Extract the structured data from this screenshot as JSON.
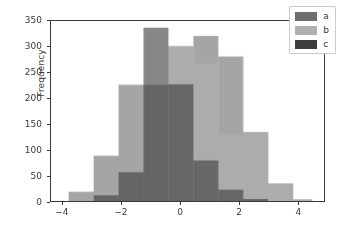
{
  "chart_data": {
    "type": "bar",
    "subtype": "histogram-overlapping",
    "title": "",
    "xlabel": "",
    "ylabel": "Frequency",
    "xlim": [
      -4.4,
      4.9
    ],
    "ylim": [
      0,
      350
    ],
    "grid": false,
    "legend_position": "upper right",
    "xticks": [
      -4,
      -2,
      0,
      2,
      4
    ],
    "xtick_labels": [
      "−4",
      "−2",
      "0",
      "2",
      "4"
    ],
    "yticks": [
      0,
      50,
      100,
      150,
      200,
      250,
      300,
      350
    ],
    "ytick_labels": [
      "0",
      "50",
      "100",
      "150",
      "200",
      "250",
      "300",
      "350"
    ],
    "bin_edges": [
      -3.8,
      -2.95,
      -2.1,
      -1.25,
      -0.4,
      0.45,
      1.3,
      2.15,
      3.0,
      3.85,
      4.5
    ],
    "series": [
      {
        "name": "a",
        "color": "#6e6e6e",
        "values": [
          18,
          88,
          226,
          226,
          301,
          321,
          281,
          134,
          34,
          3
        ]
      },
      {
        "name": "b",
        "color": "#b0b0b0",
        "values": [
          0,
          0,
          0,
          0,
          301,
          268,
          130,
          134,
          34,
          3
        ]
      },
      {
        "name": "c",
        "color": "#3d3d3d",
        "values": [
          0,
          11,
          56,
          337,
          227,
          79,
          22,
          4,
          0,
          0
        ]
      }
    ],
    "legend_entries": [
      {
        "label": "a",
        "color": "#6e6e6e"
      },
      {
        "label": "b",
        "color": "#b0b0b0"
      },
      {
        "label": "c",
        "color": "#3d3d3d"
      }
    ],
    "colors": {
      "series_a": "#6e6e6e",
      "series_b": "#b0b0b0",
      "series_c": "#3d3d3d",
      "overlap_dark": "#2b2b2b",
      "axis": "#3a3a3a",
      "background": "#ffffff"
    }
  }
}
